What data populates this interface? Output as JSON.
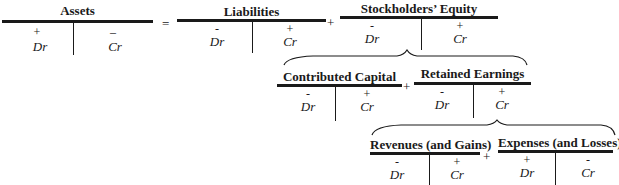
{
  "accounts": {
    "assets": {
      "title": "Assets",
      "left_sign": "+",
      "left_label": "Dr",
      "right_sign": "–",
      "right_label": "Cr"
    },
    "liabilities": {
      "title": "Liabilities",
      "left_sign": "-",
      "left_label": "Dr",
      "right_sign": "+",
      "right_label": "Cr"
    },
    "stockholders_equity": {
      "title": "Stockholders’ Equity",
      "left_sign": "-",
      "left_label": "Dr",
      "right_sign": "+",
      "right_label": "Cr"
    },
    "contributed_capital": {
      "title": "Contributed Capital",
      "left_sign": "-",
      "left_label": "Dr",
      "right_sign": "+",
      "right_label": "Cr"
    },
    "retained_earnings": {
      "title": "Retained Earnings",
      "left_sign": "-",
      "left_label": "Dr",
      "right_sign": "+",
      "right_label": "Cr"
    },
    "revenues": {
      "title": "Revenues (and Gains)",
      "left_sign": "-",
      "left_label": "Dr",
      "right_sign": "+",
      "right_label": "Cr"
    },
    "expenses": {
      "title": "Expenses (and Losses)",
      "left_sign": "+",
      "left_label": "Dr",
      "right_sign": "-",
      "right_label": "Cr"
    }
  },
  "operators": {
    "equals": "=",
    "plus_liab_se": "+",
    "plus_cc_re": "+",
    "plus_rev_exp": "+"
  }
}
